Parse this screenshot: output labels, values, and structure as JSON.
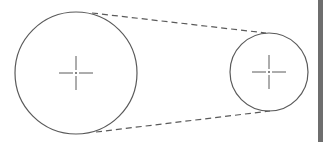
{
  "diagram": {
    "type": "belt-pulley",
    "colors": {
      "background": "#ffffff",
      "stroke": "#5a5a5a",
      "edge_bar": "#6e6e6e"
    },
    "pulleys": [
      {
        "name": "large-pulley",
        "cx": 76,
        "cy": 73,
        "r": 61
      },
      {
        "name": "small-pulley",
        "cx": 269,
        "cy": 72,
        "r": 39
      }
    ],
    "belt_lines": [
      {
        "name": "top-belt-line",
        "x1": 92,
        "y1": 13,
        "x2": 266,
        "y2": 33
      },
      {
        "name": "bottom-belt-line",
        "x1": 96,
        "y1": 132,
        "x2": 270,
        "y2": 111
      }
    ],
    "center_mark_size": 17
  }
}
